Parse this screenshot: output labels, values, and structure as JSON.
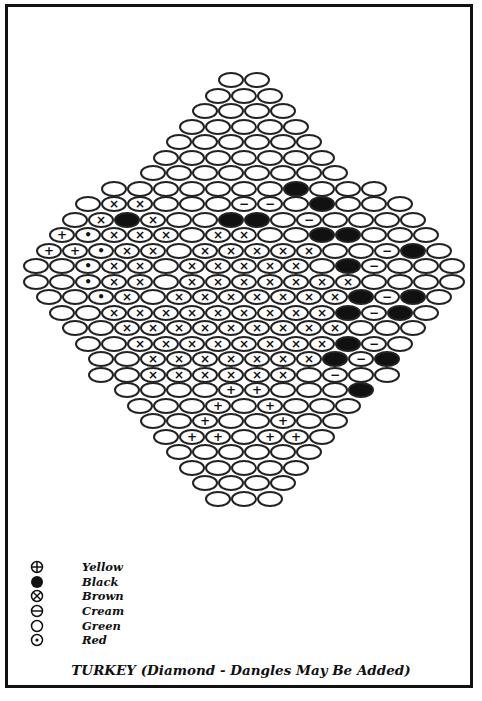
{
  "pattern": {
    "name": "Turkey beading pattern",
    "bead_pitch_x": 26,
    "row_pitch_y": 15.5,
    "center_x": 244,
    "first_row_y": 80,
    "rows": [
      "oo",
      "ooo",
      "oooo",
      "ooooo",
      "oooooo",
      "ooooooo",
      "oooooooo",
      "ooooooobooo",
      "oxxoooccobooo",
      "oxbxoobbocoooo",
      "yrxxxoxxoobbooo",
      "yyrxxoxxxxxoocbo",
      "oorxxoxxxxxobcooo",
      "oorxxoxxxxxxxoooo",
      "oorxoxxxxxxxbcbo",
      "ooxxxxxxxxxbcbo",
      "ooxxxxxxxxxooo",
      "ooxxxxxxxxbco",
      "ooxxxxxxxbcb",
      "ooxxxxxxocoo",
      "ooooyyooob",
      "oooyoyooo",
      "ooyooyoo",
      "oyyoyyo",
      "oooooo",
      "ooooo",
      "oooo",
      "ooo"
    ]
  },
  "legend": [
    {
      "symbol": "yellow-plus",
      "label": "Yellow"
    },
    {
      "symbol": "black-fill",
      "label": "Black"
    },
    {
      "symbol": "brown-cross",
      "label": "Brown"
    },
    {
      "symbol": "cream-minus",
      "label": "Cream"
    },
    {
      "symbol": "green-empty",
      "label": "Green"
    },
    {
      "symbol": "red-dot",
      "label": "Red"
    }
  ],
  "title": "TURKEY (Diamond - Dangles May Be Added)"
}
